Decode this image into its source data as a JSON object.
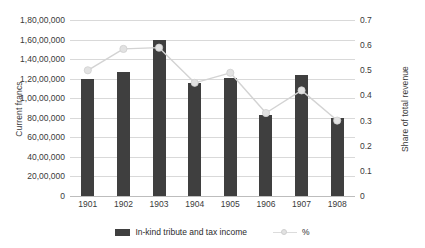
{
  "chart_data": {
    "type": "bar",
    "title": "",
    "categories": [
      "1901",
      "1902",
      "1903",
      "1904",
      "1905",
      "1906",
      "1907",
      "1908"
    ],
    "xlabel": "",
    "ylabel": "Current francs",
    "y2label": "Share of total revenue",
    "ylim": [
      0,
      18000000
    ],
    "y2lim": [
      0,
      0.7
    ],
    "grid": true,
    "legend_position": "bottom",
    "y_ticks": [
      "0",
      "20,00,000",
      "40,00,000",
      "60,00,000",
      "80,00,000",
      "1,00,00,000",
      "1,20,00,000",
      "1,40,00,000",
      "1,60,00,000",
      "1,80,00,000"
    ],
    "y_tick_values": [
      0,
      2000000,
      4000000,
      6000000,
      8000000,
      10000000,
      12000000,
      14000000,
      16000000,
      18000000
    ],
    "y2_ticks": [
      "0",
      "0.1",
      "0.2",
      "0.3",
      "0.4",
      "0.5",
      "0.6",
      "0.7"
    ],
    "y2_tick_values": [
      0,
      0.1,
      0.2,
      0.3,
      0.4,
      0.5,
      0.6,
      0.7
    ],
    "series": [
      {
        "name": "In-kind tribute and tax income",
        "type": "bar",
        "axis": "left",
        "color": "#3f3f3f",
        "values": [
          12000000,
          12700000,
          16000000,
          11600000,
          12100000,
          8300000,
          12400000,
          8000000
        ]
      },
      {
        "name": "%",
        "type": "line",
        "axis": "right",
        "color": "#d3d3d3",
        "values": [
          0.5,
          0.585,
          0.59,
          0.45,
          0.49,
          0.33,
          0.42,
          0.3
        ]
      }
    ]
  },
  "legend": {
    "items": [
      {
        "label": "In-kind tribute and tax income",
        "marker": "bar-swatch"
      },
      {
        "label": "%",
        "marker": "line-marker-swatch"
      }
    ]
  }
}
